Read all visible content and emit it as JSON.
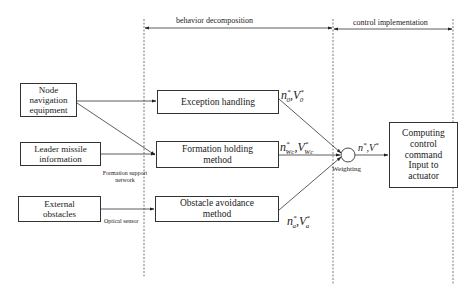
{
  "phases": {
    "behavior_decomposition": "behavior decomposition",
    "control_implementation": "control implementation"
  },
  "inputs": {
    "node_navigation": "Node navigation equipment",
    "leader_missile": "Leader missile information",
    "external_obstacles": "External obstacles"
  },
  "behaviors": {
    "exception_handling": "Exception handling",
    "formation_holding": "Formation holding method",
    "obstacle_avoidance": "Obstacle avoidance method"
  },
  "channel_labels": {
    "formation_support_network": "Formation support network",
    "optical_sensor": "Optical sensor"
  },
  "outputs": {
    "exception": {
      "n": "n",
      "n_sub": "0",
      "v": "V",
      "v_sub": "0",
      "sup": "*"
    },
    "formation": {
      "n": "n",
      "n_sub": "Wc",
      "v": "V",
      "v_sub": "Wc",
      "sup": "*"
    },
    "obstacle": {
      "n": "n",
      "n_sub": "a",
      "v": "V",
      "v_sub": "a",
      "sup": "*"
    },
    "combined": {
      "n": "n",
      "v": "V",
      "sup": "*"
    }
  },
  "weighting_label": "Weighting",
  "actuator_box": "Computing control command Input to actuator",
  "colors": {
    "line": "#333333",
    "dashed": "#555555",
    "background": "#ffffff"
  }
}
